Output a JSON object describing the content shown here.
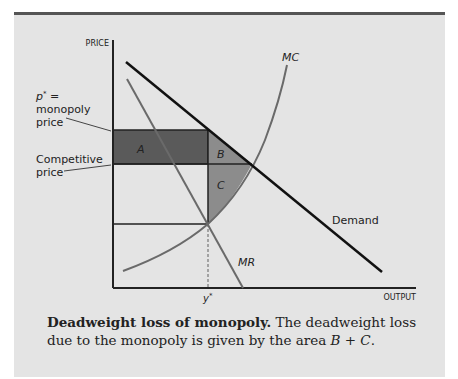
{
  "figure": {
    "axes": {
      "y_label": "PRICE",
      "x_label": "OUTPUT"
    },
    "curves": {
      "demand_label": "Demand",
      "mc_label": "MC",
      "mr_label": "MR"
    },
    "regions": {
      "a_label": "A",
      "b_label": "B",
      "c_label": "C"
    },
    "annotations": {
      "monopoly_price_line1_symbol": "p",
      "monopoly_price_line1_sup": "*",
      "monopoly_price_line1_suffix": " =",
      "monopoly_price_line2": "monopoly",
      "monopoly_price_line3": "price",
      "competitive_price_line1": "Competitive",
      "competitive_price_line2": "price",
      "quantity_symbol": "y",
      "quantity_sup": "*"
    },
    "colors": {
      "background": "#e4e4e4",
      "region_a": "#5a5a5a",
      "region_b": "#8c8c8c",
      "region_c": "#8c8c8c",
      "demand": "#111111",
      "mr": "#6a6a6a",
      "mc": "#6a6a6a",
      "axes": "#222222"
    }
  },
  "caption": {
    "title": "Deadweight loss of monopoly",
    "title_period": ".",
    "text_part1": " The deadweight loss due to the monopoly is given by the area ",
    "formula_b": "B",
    "formula_plus": " + ",
    "formula_c": "C",
    "formula_end": "."
  }
}
